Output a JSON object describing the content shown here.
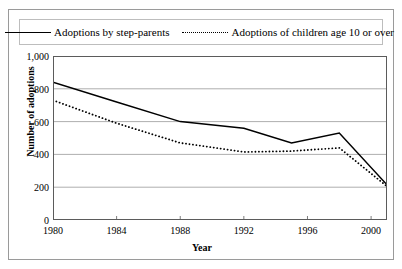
{
  "chart_data": {
    "type": "line",
    "title": "",
    "xlabel": "Year",
    "ylabel": "Number of adoptions",
    "xlim": [
      1980,
      2001
    ],
    "ylim": [
      0,
      1000
    ],
    "xticks": [
      1980,
      1984,
      1988,
      1992,
      1996,
      2000
    ],
    "yticks": [
      0,
      200,
      400,
      600,
      800,
      1000
    ],
    "ytick_labels": [
      "0",
      "200",
      "400",
      "600",
      "800",
      "1,000"
    ],
    "grid": "horizontal",
    "legend_position": "top",
    "series": [
      {
        "name": "Adoptions by step-parents",
        "style": "solid",
        "x": [
          1980,
          1984,
          1988,
          1992,
          1995,
          1998,
          2001
        ],
        "values": [
          840,
          720,
          600,
          560,
          470,
          530,
          215
        ]
      },
      {
        "name": "Adoptions of children age 10 or over",
        "style": "dotted",
        "x": [
          1980,
          1984,
          1988,
          1992,
          1995,
          1998,
          2001
        ],
        "values": [
          730,
          590,
          470,
          415,
          420,
          440,
          205
        ]
      }
    ]
  },
  "legend": {
    "entries": [
      {
        "label": "Adoptions by step-parents"
      },
      {
        "label": "Adoptions of children age 10 or over"
      }
    ]
  }
}
